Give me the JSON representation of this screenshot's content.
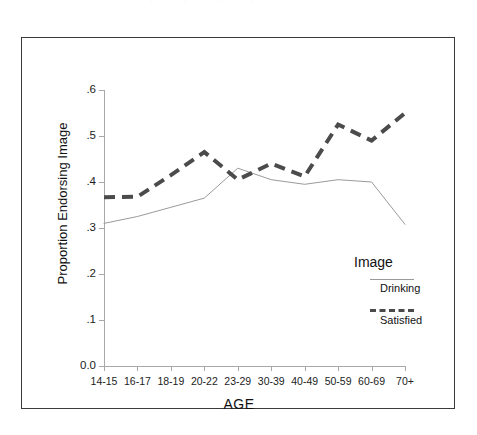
{
  "figure": {
    "scan_artifact_text": "·  ·  ·  ·",
    "frame_color": "#3a3a3a",
    "background": "#ffffff"
  },
  "chart_data": {
    "type": "line",
    "title": "",
    "xlabel": "AGE",
    "ylabel": "Proportion Endorsing Image",
    "categories": [
      "14-15",
      "16-17",
      "18-19",
      "20-22",
      "23-29",
      "30-39",
      "40-49",
      "50-59",
      "60-69",
      "70+"
    ],
    "ylim": [
      0.0,
      0.6
    ],
    "ytick_labels": [
      "0.0",
      ".1",
      ".2",
      ".3",
      ".4",
      ".5",
      ".6"
    ],
    "ytick_values": [
      0.0,
      0.1,
      0.2,
      0.3,
      0.4,
      0.5,
      0.6
    ],
    "grid": false,
    "legend_position": "right",
    "legend_title": "Image",
    "series": [
      {
        "name": "Drinking",
        "style": "thin-solid",
        "color": "#9a9a9a",
        "values": [
          0.31,
          0.325,
          0.345,
          0.365,
          0.43,
          0.405,
          0.395,
          0.405,
          0.4,
          0.308
        ]
      },
      {
        "name": "Satisfied",
        "style": "thick-dashed",
        "color": "#4b4b4b",
        "values": [
          0.367,
          0.368,
          0.415,
          0.465,
          0.405,
          0.44,
          0.412,
          0.525,
          0.49,
          0.55
        ]
      }
    ]
  }
}
